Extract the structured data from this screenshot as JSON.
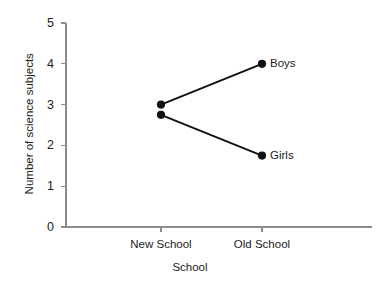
{
  "chart_data": {
    "type": "line",
    "title": "",
    "subtitle": "",
    "xlabel": "School",
    "ylabel": "Number of science subjects",
    "categories": [
      "New School",
      "Old School"
    ],
    "x_tick_labels": [
      "New School",
      "Old School"
    ],
    "y_tick_labels": [
      "0",
      "1",
      "2",
      "3",
      "4",
      "5"
    ],
    "y_ticks": [
      0,
      1,
      2,
      3,
      4,
      5
    ],
    "ylim": [
      0,
      5
    ],
    "grid": false,
    "legend_position": "inline-right-of-endpoint",
    "series": [
      {
        "name": "Boys",
        "values": [
          3,
          4
        ],
        "color": "#111111",
        "end_label": "Boys"
      },
      {
        "name": "Girls",
        "values": [
          2.75,
          1.75
        ],
        "color": "#111111",
        "end_label": "Girls"
      }
    ],
    "annotations": [
      {
        "text": "Boys",
        "x": "Old School",
        "y": 4
      },
      {
        "text": "Girls",
        "x": "Old School",
        "y": 1.75
      }
    ],
    "style": {
      "axis_color": "#8c8c8c",
      "line_color": "#111111",
      "marker_color": "#111111",
      "background": "#ffffff"
    }
  },
  "figure": {
    "axis_title_y": "Number of science subjects",
    "axis_title_x": "School"
  }
}
